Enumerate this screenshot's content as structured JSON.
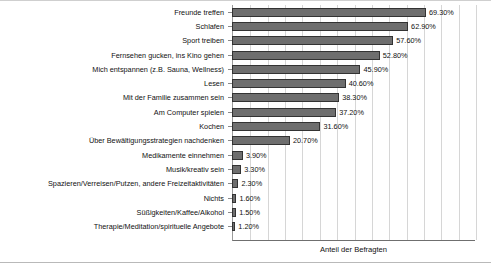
{
  "chart_data": {
    "type": "bar",
    "orientation": "horizontal",
    "title": "",
    "subtitle": "",
    "xlabel": "Anteil der Befragten",
    "ylabel": "",
    "xlim": [
      0,
      86.8
    ],
    "grid": true,
    "grid_axis": "x",
    "grid_interval": 6.2,
    "legend": null,
    "value_label_suffix": "%",
    "categories": [
      "Freunde treffen",
      "Schlafen",
      "Sport treiben",
      "Fernsehen gucken, ins Kino gehen",
      "Mich entspannen (z.B. Sauna, Wellness)",
      "Lesen",
      "Mit der Familie zusammen sein",
      "Am Computer spielen",
      "Kochen",
      "Über Bewältigungsstrategien nachdenken",
      "Medikamente einnehmen",
      "Musik/kreativ sein",
      "Spazieren/Verreisen/Putzen, andere Freizeitaktivitäten",
      "Nichts",
      "Süßigkeiten/Kaffee/Alkohol",
      "Therapie/Meditation/spirituelle Angebote"
    ],
    "values": [
      69.3,
      62.9,
      57.6,
      52.8,
      45.9,
      40.6,
      38.3,
      37.2,
      31.6,
      20.7,
      3.9,
      3.3,
      2.3,
      1.6,
      1.5,
      1.2
    ],
    "value_labels": [
      "69.30%",
      "62.90%",
      "57.60%",
      "52.80%",
      "45.90%",
      "40.60%",
      "38.30%",
      "37.20%",
      "31.60%",
      "20.70%",
      "3.90%",
      "3.30%",
      "2.30%",
      "1.60%",
      "1.50%",
      "1.20%"
    ],
    "colors": {
      "bar_fill": "#6e6e6e",
      "bar_border": "#333333",
      "gridline": "#d6d6d6",
      "axis": "#6f6f6f",
      "text": "#111111",
      "background": "#ffffff"
    }
  }
}
